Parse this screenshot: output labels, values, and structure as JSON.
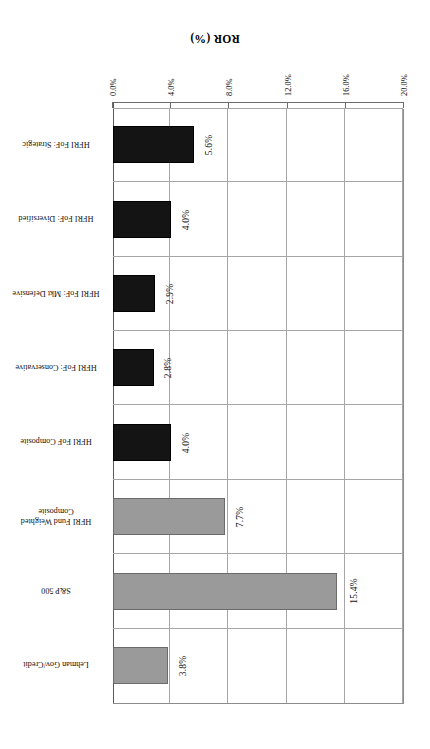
{
  "chart_data": {
    "type": "bar",
    "orientation": "horizontal",
    "title": "",
    "xlabel": "ROR (%)",
    "ylabel": "",
    "axis_title": "ROR (%)",
    "xlim": [
      0,
      20
    ],
    "x_tick_labels": [
      "0.0%",
      "4.0%",
      "8.0%",
      "12.0%",
      "16.0%",
      "20.0%"
    ],
    "x_tick_values": [
      0,
      4,
      8,
      12,
      16,
      20
    ],
    "grid": true,
    "legend": "none",
    "rotation": "180deg",
    "categories": [
      "HFRI FoF: Strategic",
      "HFRI FoF: Diversified",
      "HFRI FoF: Mkt Defensive",
      "HFRI FoF: Conservative",
      "HFRI FoF Composite",
      "HFRI Fund Weighted\nComposite",
      "S&P 500",
      "Lehman Gov/Credit"
    ],
    "values": [
      5.6,
      4.0,
      2.9,
      2.8,
      4.0,
      7.7,
      15.4,
      3.8
    ],
    "data_labels": [
      "5.6%",
      "4.0%",
      "2.9%",
      "2.8%",
      "4.0%",
      "7.7%",
      "15.4%",
      "3.8%"
    ],
    "bar_colors": [
      "#141414",
      "#141414",
      "#141414",
      "#141414",
      "#141414",
      "#9a9a9a",
      "#9a9a9a",
      "#9a9a9a"
    ],
    "series": [
      {
        "name": "ROR (%)",
        "values": [
          5.6,
          4.0,
          2.9,
          2.8,
          4.0,
          7.7,
          15.4,
          3.8
        ]
      }
    ]
  }
}
